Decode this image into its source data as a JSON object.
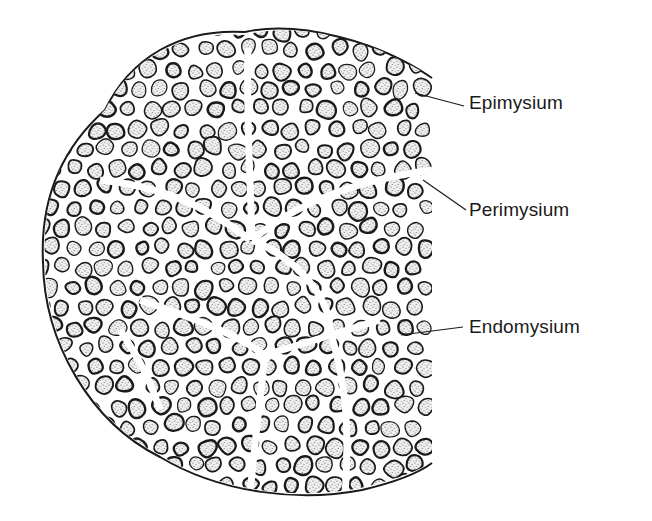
{
  "figure": {
    "labels": [
      {
        "id": "epimysium",
        "text": "Epimysium",
        "x": 469,
        "y": 92,
        "line": [
          [
            415,
            93
          ],
          [
            464,
            106
          ]
        ]
      },
      {
        "id": "perimysium",
        "text": "Perimysium",
        "x": 469,
        "y": 199,
        "line": [
          [
            423,
            180
          ],
          [
            466,
            210
          ]
        ]
      },
      {
        "id": "endomysium",
        "text": "Endomysium",
        "x": 469,
        "y": 316,
        "line": [
          [
            401,
            335
          ],
          [
            463,
            327
          ]
        ]
      }
    ],
    "colors": {
      "outline": "#1a1a1a",
      "fiber_fill": "#e9e9e9",
      "stipple": "#555555",
      "background": "#ffffff"
    }
  }
}
